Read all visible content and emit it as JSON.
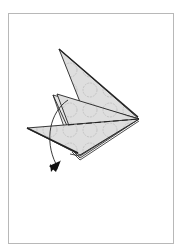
{
  "diagram": {
    "type": "origami-step",
    "colors": {
      "paper_fill": "#dcdcdc",
      "paper_pattern": "#bdbdbd",
      "outline": "#222222",
      "frame_border": "#b8b8b8",
      "background": "#ffffff"
    },
    "elements": {
      "fold_line": "dashed-valley-fold",
      "arrow": "curved-fold-arrow"
    }
  }
}
